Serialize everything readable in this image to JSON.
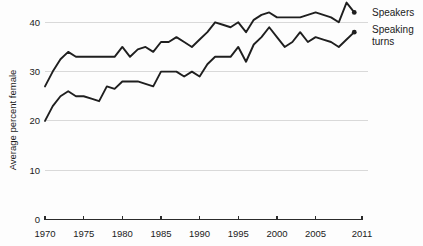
{
  "chart_data": {
    "type": "line",
    "title": "",
    "subtitle": "",
    "xlabel": "",
    "ylabel": "Average percent female",
    "xlim": [
      1970,
      2011
    ],
    "ylim": [
      0,
      44
    ],
    "y_ticks": [
      0,
      10,
      20,
      30,
      40
    ],
    "y_tick_labels": [
      "0",
      "10",
      "20",
      "30",
      "40"
    ],
    "x_ticks": [
      1970,
      1975,
      1980,
      1985,
      1990,
      1995,
      2000,
      2005,
      2011
    ],
    "x_tick_labels": [
      "1970",
      "1975",
      "1980",
      "1985",
      "1990",
      "1995",
      "2000",
      "2005",
      "2011"
    ],
    "grid": "horizontal",
    "legend_position": "right-inline",
    "x": [
      1970,
      1971,
      1972,
      1973,
      1974,
      1975,
      1976,
      1977,
      1978,
      1979,
      1980,
      1981,
      1982,
      1983,
      1984,
      1985,
      1986,
      1987,
      1988,
      1989,
      1990,
      1991,
      1992,
      1993,
      1994,
      1995,
      1996,
      1997,
      1998,
      1999,
      2000,
      2001,
      2002,
      2003,
      2004,
      2005,
      2006,
      2007,
      2008,
      2009,
      2010
    ],
    "series": [
      {
        "name": "Speakers",
        "label": "Speakers",
        "color": "#1f1f1f",
        "endpoint_marker": true,
        "values": [
          27.0,
          30.0,
          32.5,
          34.0,
          33.0,
          33.0,
          33.0,
          33.0,
          33.0,
          33.0,
          35.0,
          33.0,
          34.5,
          35.0,
          34.0,
          36.0,
          36.0,
          37.0,
          36.0,
          35.0,
          36.5,
          38.0,
          40.0,
          39.5,
          39.0,
          40.0,
          38.0,
          40.5,
          41.5,
          42.0,
          41.0,
          41.0,
          41.0,
          41.0,
          41.5,
          42.0,
          41.5,
          41.0,
          40.0,
          44.0,
          42.0
        ]
      },
      {
        "name": "Speaking turns",
        "label": "Speaking turns",
        "label_lines": [
          "Speaking",
          "turns"
        ],
        "color": "#1f1f1f",
        "endpoint_marker": true,
        "values": [
          20.0,
          23.0,
          25.0,
          26.0,
          25.0,
          25.0,
          24.5,
          24.0,
          27.0,
          26.5,
          28.0,
          28.0,
          28.0,
          27.5,
          27.0,
          30.0,
          30.0,
          30.0,
          29.0,
          30.0,
          29.0,
          31.5,
          33.0,
          33.0,
          33.0,
          35.0,
          32.0,
          35.5,
          37.0,
          39.0,
          37.0,
          35.0,
          36.0,
          38.0,
          36.0,
          37.0,
          36.5,
          36.0,
          35.0,
          36.5,
          38.0
        ]
      }
    ]
  },
  "axis": {
    "y_title": "Average percent female"
  },
  "legend": {
    "speakers_label": "Speakers",
    "turns_label_line1": "Speaking",
    "turns_label_line2": "turns"
  }
}
